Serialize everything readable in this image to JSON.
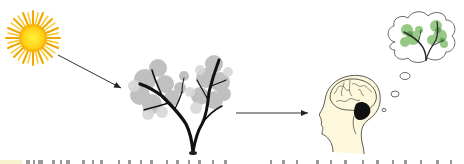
{
  "diagram": {
    "type": "process-flow",
    "nodes": [
      {
        "id": "sun",
        "label": "",
        "icon": "sun-icon",
        "color_core": "#ffe21a",
        "color_rays": "#f0a800"
      },
      {
        "id": "tree",
        "label": "",
        "icon": "tree-icon",
        "color_foliage": "#b8b8b8",
        "color_trunk": "#111111"
      },
      {
        "id": "head",
        "label": "",
        "icon": "head-brain-icon",
        "color_skin": "#fdf8dc",
        "color_outline": "#333333"
      },
      {
        "id": "thought",
        "label": "",
        "icon": "thought-bubble-tree-icon",
        "color_foliage": "#7fb872"
      }
    ],
    "edges": [
      {
        "from": "sun",
        "to": "tree"
      },
      {
        "from": "tree",
        "to": "head"
      },
      {
        "from": "head",
        "to": "thought",
        "style": "thought-bubbles"
      }
    ],
    "caption_cutoff": "text line cropped at bottom edge (illegible)"
  }
}
